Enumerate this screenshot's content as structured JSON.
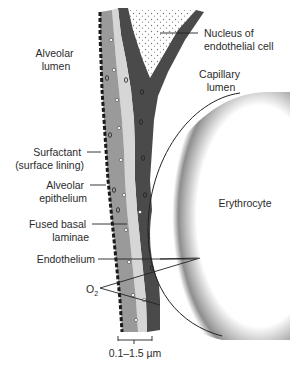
{
  "diagram": {
    "colors": {
      "surfactant": "#1a1a1a",
      "alveolar_epithelium": "#9a9a9a",
      "basal_laminae": "#d6d6d6",
      "endothelium": "#4a4a4a",
      "nucleus_stipple": "#777777",
      "erythrocyte_rim": "#8a8a8a",
      "text": "#2b2b2b"
    },
    "labels": {
      "alveolar_lumen": [
        "Alveolar",
        "lumen"
      ],
      "surfactant": [
        "Surfactant",
        "(surface lining)"
      ],
      "alveolar_epithelium": [
        "Alveolar",
        "epithelium"
      ],
      "fused_basal_laminae": [
        "Fused basal",
        "laminae"
      ],
      "endothelium": "Endothelium",
      "oxygen": "O",
      "oxygen_subscript": "2",
      "nucleus": [
        "Nucleus of",
        "endothelial cell"
      ],
      "capillary_lumen": [
        "Capillary",
        "lumen"
      ],
      "erythrocyte": "Erythrocyte",
      "scale": "0.1–1.5 µm"
    }
  }
}
